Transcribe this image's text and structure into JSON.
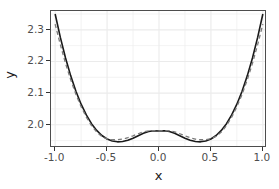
{
  "chart_data": {
    "type": "line",
    "title": "",
    "xlabel": "x",
    "ylabel": "y",
    "xlim": [
      -1.04,
      1.04
    ],
    "ylim": [
      1.9265,
      2.3595
    ],
    "grid": true,
    "grid_color": "#ebebeb",
    "panel_background": "#ffffff",
    "legend": "none",
    "x_ticks": [
      {
        "value": -1.0,
        "label": "-1.0"
      },
      {
        "value": -0.5,
        "label": "-0.5"
      },
      {
        "value": 0.0,
        "label": "0.0"
      },
      {
        "value": 0.5,
        "label": "0.5"
      },
      {
        "value": 1.0,
        "label": "1.0"
      }
    ],
    "y_ticks": [
      {
        "value": 2.0,
        "label": "2.0"
      },
      {
        "value": 2.1,
        "label": "2.1"
      },
      {
        "value": 2.2,
        "label": "2.2"
      },
      {
        "value": 2.3,
        "label": "2.3"
      }
    ],
    "x_minor_ticks": [
      -0.75,
      -0.25,
      0.25,
      0.75
    ],
    "y_minor_ticks": [
      1.95,
      2.05,
      2.15,
      2.25,
      2.35
    ],
    "series": [
      {
        "name": "solid-curve",
        "style": "solid",
        "color": "#1a1a1a",
        "width": 1.6,
        "x": [
          -1.0,
          -0.95,
          -0.9,
          -0.85,
          -0.8,
          -0.75,
          -0.7,
          -0.65,
          -0.6,
          -0.55,
          -0.5,
          -0.45,
          -0.4,
          -0.35,
          -0.3,
          -0.25,
          -0.2,
          -0.15,
          -0.1,
          -0.05,
          0.0,
          0.05,
          0.1,
          0.15,
          0.2,
          0.25,
          0.3,
          0.35,
          0.4,
          0.45,
          0.5,
          0.55,
          0.6,
          0.65,
          0.7,
          0.75,
          0.8,
          0.85,
          0.9,
          0.95,
          1.0
        ],
        "y": [
          2.35,
          2.276,
          2.211,
          2.1545,
          2.106,
          2.065,
          2.031,
          2.0035,
          1.982,
          1.966,
          1.955,
          1.9485,
          1.946,
          1.947,
          1.951,
          1.9575,
          1.9655,
          1.973,
          1.9785,
          1.981,
          1.98,
          1.981,
          1.9785,
          1.973,
          1.9655,
          1.9575,
          1.951,
          1.947,
          1.946,
          1.9485,
          1.955,
          1.966,
          1.982,
          2.0035,
          2.031,
          2.065,
          2.106,
          2.1545,
          2.211,
          2.276,
          2.35
        ]
      },
      {
        "name": "dashed-curve",
        "style": "dashed",
        "color": "#7a7a7a",
        "width": 1.3,
        "x": [
          -1.0,
          -0.95,
          -0.9,
          -0.85,
          -0.8,
          -0.75,
          -0.7,
          -0.65,
          -0.6,
          -0.55,
          -0.5,
          -0.45,
          -0.4,
          -0.35,
          -0.3,
          -0.25,
          -0.2,
          -0.15,
          -0.1,
          -0.05,
          0.0,
          0.05,
          0.1,
          0.15,
          0.2,
          0.25,
          0.3,
          0.35,
          0.4,
          0.45,
          0.5,
          0.55,
          0.6,
          0.65,
          0.7,
          0.75,
          0.8,
          0.85,
          0.9,
          0.95,
          1.0
        ],
        "y": [
          2.318,
          2.253,
          2.194,
          2.142,
          2.096,
          2.057,
          2.024,
          1.9975,
          1.977,
          1.963,
          1.9555,
          1.9525,
          1.9525,
          1.9545,
          1.959,
          1.965,
          1.9715,
          1.9775,
          1.981,
          1.9815,
          1.9805,
          1.9815,
          1.981,
          1.9775,
          1.9715,
          1.965,
          1.959,
          1.9545,
          1.9525,
          1.9525,
          1.9555,
          1.963,
          1.977,
          1.9975,
          2.024,
          2.057,
          2.096,
          2.142,
          2.194,
          2.253,
          2.318
        ]
      }
    ]
  },
  "axes": {
    "x_title": "x",
    "y_title": "y"
  }
}
